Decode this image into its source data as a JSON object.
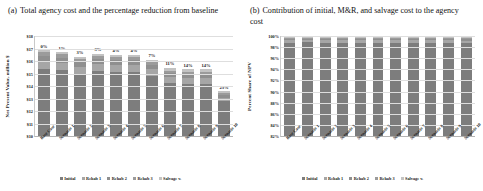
{
  "chart_data": [
    {
      "id": "a",
      "type": "bar",
      "panel_label": "(a)",
      "title": "Total agency cost and the percentage reduction from baseline",
      "xlabel": "",
      "ylabel": "Net Present Value, million $",
      "ylim": [
        10,
        18
      ],
      "yticks": [
        18,
        17,
        16,
        15,
        14,
        13,
        12,
        11,
        10
      ],
      "ytick_labels": [
        "$18",
        "$17",
        "$16",
        "$15",
        "$14",
        "$13",
        "$12",
        "$11",
        "$10"
      ],
      "grid": true,
      "legend_position": "bottom",
      "categories": [
        "Base Case",
        "Scenario 1",
        "Scenario 2",
        "Scenario 3",
        "Scenario 4",
        "Scenario 5",
        "Scenario 6",
        "Scenario 7",
        "Scenario 8",
        "Scenario 9",
        "Scenario 10"
      ],
      "series": [
        {
          "name": "Initial",
          "color": "#7d7d7d",
          "values": [
            13.2,
            13.1,
            12.85,
            13.05,
            12.95,
            12.95,
            12.65,
            12.1,
            12.05,
            12.05,
            10.55
          ]
        },
        {
          "name": "Rehab 1",
          "color": "#a6a6a6",
          "values": [
            1.55,
            1.5,
            1.45,
            1.45,
            1.45,
            1.45,
            1.4,
            1.3,
            1.25,
            1.25,
            1.05
          ]
        },
        {
          "name": "Rehab 2",
          "color": "#8f8f8f",
          "values": [
            1.05,
            1.0,
            0.95,
            0.95,
            0.95,
            0.95,
            0.9,
            0.85,
            0.85,
            0.85,
            0.75
          ]
        },
        {
          "name": "Rehab 3",
          "color": "#9b9b9b",
          "values": [
            0.7,
            0.7,
            0.65,
            0.7,
            0.65,
            0.65,
            0.65,
            0.6,
            0.6,
            0.6,
            0.55
          ]
        },
        {
          "name": "Salvage v.",
          "color": "#c3c3c3",
          "values": [
            0.35,
            0.4,
            0.45,
            0.45,
            0.5,
            0.5,
            0.5,
            0.6,
            0.6,
            0.6,
            0.7
          ]
        }
      ],
      "totals": [
        16.85,
        16.7,
        16.35,
        16.6,
        16.5,
        16.5,
        16.1,
        15.45,
        15.35,
        15.35,
        13.6
      ],
      "data_labels": [
        "0%",
        "1%",
        "3%",
        "3%",
        "4%",
        "4%",
        "7%",
        "11%",
        "14%",
        "14%",
        "23%"
      ]
    },
    {
      "id": "b",
      "type": "bar",
      "panel_label": "(b)",
      "title": "Contribution of initial, M&R, and salvage cost to the agency cost",
      "xlabel": "",
      "ylabel": "Percent Share of NPV",
      "ylim": [
        82,
        100
      ],
      "yticks": [
        100,
        98,
        96,
        94,
        92,
        90,
        88,
        86,
        84,
        82
      ],
      "ytick_labels": [
        "100%",
        "98%",
        "96%",
        "94%",
        "92%",
        "90%",
        "88%",
        "86%",
        "84%",
        "82%"
      ],
      "grid": true,
      "legend_position": "bottom",
      "categories": [
        "Base Case",
        "Scenario 1",
        "Scenario 2",
        "Scenario 3",
        "Scenario 4",
        "Scenario 5",
        "Scenario 6",
        "Scenario 7",
        "Scenario 8",
        "Scenario 9",
        "Scenario 10"
      ],
      "series": [
        {
          "name": "Initial",
          "color": "#7d7d7d",
          "values": [
            93.5,
            93.6,
            93.5,
            93.4,
            93.4,
            93.3,
            93.3,
            93.1,
            93.0,
            93.0,
            92.8
          ]
        },
        {
          "name": "Rehab 1",
          "color": "#a6a6a6",
          "values": [
            2.4,
            2.3,
            2.4,
            2.4,
            2.4,
            2.5,
            2.5,
            2.5,
            2.6,
            2.6,
            2.6
          ]
        },
        {
          "name": "Rehab 2",
          "color": "#8f8f8f",
          "values": [
            1.5,
            1.5,
            1.5,
            1.5,
            1.5,
            1.5,
            1.5,
            1.6,
            1.6,
            1.6,
            1.7
          ]
        },
        {
          "name": "Rehab 3",
          "color": "#9b9b9b",
          "values": [
            1.0,
            1.0,
            1.0,
            1.1,
            1.1,
            1.1,
            1.1,
            1.1,
            1.1,
            1.1,
            1.1
          ]
        },
        {
          "name": "Salvage v.",
          "color": "#c3c3c3",
          "values": [
            1.6,
            1.6,
            1.6,
            1.6,
            1.6,
            1.6,
            1.6,
            1.7,
            1.7,
            1.7,
            1.8
          ]
        }
      ],
      "totals": [
        100,
        100,
        100,
        100,
        100,
        100,
        100,
        100,
        100,
        100,
        100
      ],
      "data_labels": []
    }
  ],
  "legend": {
    "items": [
      {
        "label": "Initial",
        "color": "#7d7d7d"
      },
      {
        "label": "Rehab 1",
        "color": "#a6a6a6"
      },
      {
        "label": "Rehab 2",
        "color": "#8f8f8f"
      },
      {
        "label": "Rehab 3",
        "color": "#9b9b9b"
      },
      {
        "label": "Salvage v.",
        "color": "#c3c3c3"
      }
    ]
  }
}
